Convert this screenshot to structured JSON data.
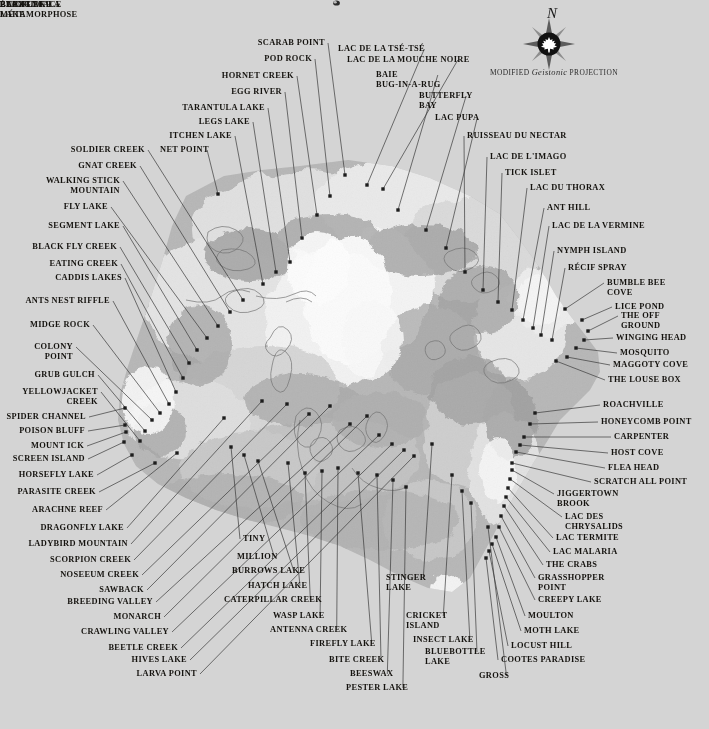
{
  "map": {
    "background_color": "#d4d4d4",
    "land_color": "#b9b9b9",
    "highland_color": "#cfcfcf",
    "ice_color": "#f2f2f2",
    "water_color": "#d8d8d8",
    "leader_color": "#3a3a3a",
    "label_color": "#15130f",
    "compass": {
      "north_letter": "N",
      "icon": "compass-rose-maple-leaf"
    },
    "projection_prefix": "MODIFIED",
    "projection_name": "Geistonic",
    "projection_suffix": "PROJECTION"
  },
  "interior_labels": [
    {
      "id": "lac-flyface",
      "text": "LAC FLYFACE",
      "x": 334,
      "y": 306,
      "align": "l"
    },
    {
      "id": "blight-lake",
      "text": "BLIGHT\nLAKE",
      "x": 331,
      "y": 318,
      "align": "l"
    },
    {
      "id": "buzz-lake",
      "text": "BUZZ LAKE",
      "x": 352,
      "y": 345,
      "align": "l"
    },
    {
      "id": "etang-metamorphose",
      "text": "ÉTANG DE LA\nMÉTAMORPHOSE",
      "x": 505,
      "y": 372,
      "align": "l"
    }
  ],
  "labels_top_left": [
    {
      "id": "scarab-point",
      "text": "SCARAB POINT",
      "tx": 325,
      "ty": 38,
      "align": "r",
      "px": 345,
      "py": 175
    },
    {
      "id": "pod-rock",
      "text": "POD ROCK",
      "tx": 312,
      "ty": 54,
      "align": "r",
      "px": 330,
      "py": 196
    },
    {
      "id": "hornet-creek",
      "text": "HORNET CREEK",
      "tx": 294,
      "ty": 71,
      "align": "r",
      "px": 317,
      "py": 215
    },
    {
      "id": "egg-river",
      "text": "EGG RIVER",
      "tx": 282,
      "ty": 87,
      "align": "r",
      "px": 302,
      "py": 238
    },
    {
      "id": "tarantula-lake",
      "text": "TARANTULA LAKE",
      "tx": 265,
      "ty": 103,
      "align": "r",
      "px": 290,
      "py": 262
    },
    {
      "id": "legs-lake",
      "text": "LEGS LAKE",
      "tx": 250,
      "ty": 117,
      "align": "r",
      "px": 276,
      "py": 272
    },
    {
      "id": "itchen-lake",
      "text": "ITCHEN LAKE",
      "tx": 232,
      "ty": 131,
      "align": "r",
      "px": 263,
      "py": 284
    },
    {
      "id": "net-point",
      "text": "NET POINT",
      "tx": 160,
      "ty": 145,
      "align": "l",
      "px": 218,
      "py": 194
    },
    {
      "id": "soldier-creek",
      "text": "SOLDIER CREEK",
      "tx": 145,
      "ty": 145,
      "align": "r",
      "px": 243,
      "py": 300
    },
    {
      "id": "gnat-creek",
      "text": "GNAT CREEK",
      "tx": 137,
      "ty": 161,
      "align": "r",
      "px": 230,
      "py": 312
    },
    {
      "id": "walking-stick",
      "text": "WALKING STICK\nMOUNTAIN",
      "tx": 120,
      "ty": 176,
      "align": "r",
      "px": 218,
      "py": 326
    },
    {
      "id": "fly-lake",
      "text": "FLY LAKE",
      "tx": 108,
      "ty": 202,
      "align": "r",
      "px": 207,
      "py": 338
    },
    {
      "id": "segment-lake",
      "text": "SEGMENT LAKE",
      "tx": 120,
      "ty": 221,
      "align": "r",
      "px": 197,
      "py": 350
    },
    {
      "id": "black-fly-creek",
      "text": "BLACK FLY CREEK",
      "tx": 117,
      "ty": 242,
      "align": "r",
      "px": 189,
      "py": 363
    },
    {
      "id": "eating-creek",
      "text": "EATING CREEK",
      "tx": 118,
      "ty": 259,
      "align": "r",
      "px": 183,
      "py": 378
    },
    {
      "id": "caddis-lakes",
      "text": "CADDIS LAKES",
      "tx": 122,
      "ty": 273,
      "align": "r",
      "px": 176,
      "py": 392
    },
    {
      "id": "ants-nest-riffle",
      "text": "ANTS NEST RIFFLE",
      "tx": 110,
      "ty": 296,
      "align": "r",
      "px": 169,
      "py": 404
    },
    {
      "id": "midge-rock",
      "text": "MIDGE ROCK",
      "tx": 90,
      "ty": 320,
      "align": "r",
      "px": 160,
      "py": 413
    },
    {
      "id": "colony-point",
      "text": "COLONY\nPOINT",
      "tx": 73,
      "ty": 342,
      "align": "r",
      "px": 152,
      "py": 420
    },
    {
      "id": "grub-gulch",
      "text": "GRUB GULCH",
      "tx": 95,
      "ty": 370,
      "align": "r",
      "px": 145,
      "py": 431
    },
    {
      "id": "yellowjacket",
      "text": "YELLOWJACKET\nCREEK",
      "tx": 98,
      "ty": 387,
      "align": "r",
      "px": 140,
      "py": 441
    },
    {
      "id": "spider-channel",
      "text": "SPIDER CHANNEL",
      "tx": 86,
      "ty": 412,
      "align": "r",
      "px": 125,
      "py": 408
    },
    {
      "id": "poison-bluff",
      "text": "POISON BLUFF",
      "tx": 85,
      "ty": 426,
      "align": "r",
      "px": 125,
      "py": 425
    },
    {
      "id": "mount-ick",
      "text": "MOUNT ICK",
      "tx": 84,
      "ty": 441,
      "align": "r",
      "px": 126,
      "py": 432
    },
    {
      "id": "screen-island",
      "text": "SCREEN ISLAND",
      "tx": 85,
      "ty": 454,
      "align": "r",
      "px": 124,
      "py": 442
    }
  ],
  "labels_left_lower": [
    {
      "id": "horsefly-lake",
      "text": "HORSEFLY LAKE",
      "tx": 94,
      "ty": 470,
      "align": "r",
      "px": 132,
      "py": 455
    },
    {
      "id": "parasite-creek",
      "text": "PARASITE CREEK",
      "tx": 96,
      "ty": 487,
      "align": "r",
      "px": 155,
      "py": 463
    },
    {
      "id": "arachne-reef",
      "text": "ARACHNE REEF",
      "tx": 103,
      "ty": 505,
      "align": "r",
      "px": 177,
      "py": 453
    },
    {
      "id": "dragonfly-lake",
      "text": "DRAGONFLY LAKE",
      "tx": 124,
      "ty": 523,
      "align": "r",
      "px": 224,
      "py": 418
    },
    {
      "id": "ladybird-mountain",
      "text": "LADYBIRD MOUNTAIN",
      "tx": 128,
      "ty": 539,
      "align": "r",
      "px": 262,
      "py": 401
    },
    {
      "id": "scorpion-creek",
      "text": "SCORPION CREEK",
      "tx": 131,
      "ty": 555,
      "align": "r",
      "px": 287,
      "py": 404
    },
    {
      "id": "noseeum-creek",
      "text": "NOSEEUM CREEK",
      "tx": 139,
      "ty": 570,
      "align": "r",
      "px": 309,
      "py": 414
    },
    {
      "id": "sawback",
      "text": "SAWBACK",
      "tx": 144,
      "ty": 585,
      "align": "r",
      "px": 330,
      "py": 406
    },
    {
      "id": "breeding-valley",
      "text": "BREEDING VALLEY",
      "tx": 153,
      "ty": 597,
      "align": "r",
      "px": 350,
      "py": 424
    },
    {
      "id": "monarch",
      "text": "MONARCH",
      "tx": 161,
      "ty": 612,
      "align": "r",
      "px": 367,
      "py": 416
    },
    {
      "id": "crawling-valley",
      "text": "CRAWLING VALLEY",
      "tx": 169,
      "ty": 627,
      "align": "r",
      "px": 379,
      "py": 435
    },
    {
      "id": "beetle-creek",
      "text": "BEETLE CREEK",
      "tx": 178,
      "ty": 643,
      "align": "r",
      "px": 392,
      "py": 444
    },
    {
      "id": "hives-lake",
      "text": "HIVES LAKE",
      "tx": 187,
      "ty": 655,
      "align": "r",
      "px": 404,
      "py": 450
    },
    {
      "id": "larva-point",
      "text": "LARVA POINT",
      "tx": 197,
      "ty": 669,
      "align": "r",
      "px": 414,
      "py": 456
    }
  ],
  "labels_bottom_centre": [
    {
      "id": "tiny",
      "text": "TINY",
      "tx": 243,
      "ty": 534,
      "align": "l",
      "px": 231,
      "py": 447
    },
    {
      "id": "million",
      "text": "MILLION",
      "tx": 237,
      "ty": 552,
      "align": "l",
      "px": 244,
      "py": 455
    },
    {
      "id": "burrows-lake",
      "text": "BURROWS LAKE",
      "tx": 232,
      "ty": 566,
      "align": "l",
      "px": 258,
      "py": 461
    },
    {
      "id": "hatch-lake",
      "text": "HATCH LAKE",
      "tx": 248,
      "ty": 581,
      "align": "l",
      "px": 288,
      "py": 463
    },
    {
      "id": "caterpillar-creek",
      "text": "CATERPILLAR CREEK",
      "tx": 224,
      "ty": 595,
      "align": "l",
      "px": 305,
      "py": 473
    },
    {
      "id": "wasp-lake",
      "text": "WASP LAKE",
      "tx": 273,
      "ty": 611,
      "align": "l",
      "px": 322,
      "py": 471
    },
    {
      "id": "antenna-creek",
      "text": "ANTENNA CREEK",
      "tx": 270,
      "ty": 625,
      "align": "l",
      "px": 338,
      "py": 468
    },
    {
      "id": "firefly-lake",
      "text": "FIREFLY LAKE",
      "tx": 310,
      "ty": 639,
      "align": "l",
      "px": 358,
      "py": 473
    },
    {
      "id": "bite-creek",
      "text": "BITE CREEK",
      "tx": 329,
      "ty": 655,
      "align": "l",
      "px": 377,
      "py": 475
    },
    {
      "id": "beeswax",
      "text": "BEESWAX",
      "tx": 350,
      "ty": 669,
      "align": "l",
      "px": 393,
      "py": 480
    },
    {
      "id": "pester-lake",
      "text": "PESTER LAKE",
      "tx": 346,
      "ty": 683,
      "align": "l",
      "px": 406,
      "py": 487
    },
    {
      "id": "stinger-lake",
      "text": "STINGER\nLAKE",
      "tx": 386,
      "ty": 573,
      "align": "l",
      "px": 432,
      "py": 444
    },
    {
      "id": "cricket-island",
      "text": "CRICKET\nISLAND",
      "tx": 406,
      "ty": 611,
      "align": "l",
      "px": 452,
      "py": 475
    },
    {
      "id": "insect-lake",
      "text": "INSECT LAKE",
      "tx": 413,
      "ty": 635,
      "align": "l",
      "px": 462,
      "py": 491
    },
    {
      "id": "bluebottle-lake",
      "text": "BLUEBOTTLE\nLAKE",
      "tx": 425,
      "ty": 647,
      "align": "l",
      "px": 471,
      "py": 503
    },
    {
      "id": "gross",
      "text": "GROSS",
      "tx": 479,
      "ty": 671,
      "align": "l",
      "px": 488,
      "py": 527
    }
  ],
  "labels_right_upper": [
    {
      "id": "lac-tsetse",
      "text": "LAC DE LA TSÉ-TSÉ",
      "tx": 338,
      "ty": 44,
      "align": "l",
      "px": 367,
      "py": 185
    },
    {
      "id": "lac-mouche-noire",
      "text": "LAC DE LA MOUCHE NOIRE",
      "tx": 347,
      "ty": 55,
      "align": "l",
      "px": 383,
      "py": 189
    },
    {
      "id": "baie-bug-in-a-rug",
      "text": "BAIE\nBUG-IN-A-RUG",
      "tx": 376,
      "ty": 70,
      "align": "l",
      "px": 398,
      "py": 210
    },
    {
      "id": "butterfly-bay",
      "text": "BUTTERFLY\nBAY",
      "tx": 419,
      "ty": 91,
      "align": "l",
      "px": 426,
      "py": 230
    },
    {
      "id": "lac-pupa",
      "text": "LAC PUPA",
      "tx": 435,
      "ty": 113,
      "align": "l",
      "px": 446,
      "py": 248
    },
    {
      "id": "ruisseau-nectar",
      "text": "RUISSEAU DU NECTAR",
      "tx": 467,
      "ty": 131,
      "align": "l",
      "px": 465,
      "py": 272
    },
    {
      "id": "lac-imago",
      "text": "LAC DE L'IMAGO",
      "tx": 490,
      "ty": 152,
      "align": "l",
      "px": 483,
      "py": 290
    },
    {
      "id": "tick-islet",
      "text": "TICK ISLET",
      "tx": 505,
      "ty": 168,
      "align": "l",
      "px": 498,
      "py": 302
    },
    {
      "id": "lac-du-thorax",
      "text": "LAC DU THORAX",
      "tx": 530,
      "ty": 183,
      "align": "l",
      "px": 512,
      "py": 310
    },
    {
      "id": "ant-hill",
      "text": "ANT HILL",
      "tx": 547,
      "ty": 203,
      "align": "l",
      "px": 523,
      "py": 320
    },
    {
      "id": "lac-de-la-vermine",
      "text": "LAC DE LA VERMINE",
      "tx": 552,
      "ty": 221,
      "align": "l",
      "px": 533,
      "py": 328
    },
    {
      "id": "nymph-island",
      "text": "NYMPH ISLAND",
      "tx": 557,
      "ty": 246,
      "align": "l",
      "px": 541,
      "py": 335
    },
    {
      "id": "recif-spray",
      "text": "RÉCIF SPRAY",
      "tx": 568,
      "ty": 263,
      "align": "l",
      "px": 552,
      "py": 340
    },
    {
      "id": "bumble-bee-cove",
      "text": "BUMBLE BEE\nCOVE",
      "tx": 607,
      "ty": 278,
      "align": "l",
      "px": 565,
      "py": 309
    },
    {
      "id": "lice-pond",
      "text": "LICE POND",
      "tx": 615,
      "ty": 302,
      "align": "l",
      "px": 582,
      "py": 320
    },
    {
      "id": "the-off-ground",
      "text": "THE OFF\nGROUND",
      "tx": 621,
      "ty": 311,
      "align": "l",
      "px": 588,
      "py": 331
    },
    {
      "id": "winging-head",
      "text": "WINGING HEAD",
      "tx": 616,
      "ty": 333,
      "align": "l",
      "px": 584,
      "py": 340
    },
    {
      "id": "mosquito",
      "text": "MOSQUITO",
      "tx": 620,
      "ty": 348,
      "align": "l",
      "px": 576,
      "py": 348
    },
    {
      "id": "maggoty-cove",
      "text": "MAGGOTY COVE",
      "tx": 613,
      "ty": 360,
      "align": "l",
      "px": 567,
      "py": 357
    },
    {
      "id": "the-louse-box",
      "text": "THE LOUSE BOX",
      "tx": 608,
      "ty": 375,
      "align": "l",
      "px": 556,
      "py": 361
    }
  ],
  "labels_right_lower": [
    {
      "id": "roachville",
      "text": "ROACHVILLE",
      "tx": 603,
      "ty": 400,
      "align": "l",
      "px": 535,
      "py": 413
    },
    {
      "id": "honeycomb-point",
      "text": "HONEYCOMB POINT",
      "tx": 601,
      "ty": 417,
      "align": "l",
      "px": 530,
      "py": 424
    },
    {
      "id": "carpenter",
      "text": "CARPENTER",
      "tx": 614,
      "ty": 432,
      "align": "l",
      "px": 524,
      "py": 437
    },
    {
      "id": "host-cove",
      "text": "HOST COVE",
      "tx": 611,
      "ty": 448,
      "align": "l",
      "px": 520,
      "py": 445
    },
    {
      "id": "flea-head",
      "text": "FLEA HEAD",
      "tx": 608,
      "ty": 463,
      "align": "l",
      "px": 516,
      "py": 452
    },
    {
      "id": "scratch-all-point",
      "text": "SCRATCH ALL POINT",
      "tx": 594,
      "ty": 477,
      "align": "l",
      "px": 512,
      "py": 463
    },
    {
      "id": "jiggertown-brook",
      "text": "JIGGERTOWN\nBROOK",
      "tx": 557,
      "ty": 489,
      "align": "l",
      "px": 512,
      "py": 470
    },
    {
      "id": "lac-des-chrysalids",
      "text": "LAC DES\nCHRYSALIDS",
      "tx": 565,
      "ty": 512,
      "align": "l",
      "px": 510,
      "py": 479
    },
    {
      "id": "lac-termite",
      "text": "LAC TERMITE",
      "tx": 556,
      "ty": 533,
      "align": "l",
      "px": 508,
      "py": 488
    },
    {
      "id": "lac-malaria",
      "text": "LAC MALARIA",
      "tx": 553,
      "ty": 547,
      "align": "l",
      "px": 506,
      "py": 497
    },
    {
      "id": "the-crabs",
      "text": "THE CRABS",
      "tx": 546,
      "ty": 560,
      "align": "l",
      "px": 504,
      "py": 506
    },
    {
      "id": "grasshopper-point",
      "text": "GRASSHOPPER\nPOINT",
      "tx": 538,
      "ty": 573,
      "align": "l",
      "px": 501,
      "py": 516
    },
    {
      "id": "creepy-lake",
      "text": "CREEPY LAKE",
      "tx": 538,
      "ty": 595,
      "align": "l",
      "px": 499,
      "py": 527
    },
    {
      "id": "moulton",
      "text": "MOULTON",
      "tx": 528,
      "ty": 611,
      "align": "l",
      "px": 496,
      "py": 537
    },
    {
      "id": "moth-lake",
      "text": "MOTH LAKE",
      "tx": 524,
      "ty": 626,
      "align": "l",
      "px": 492,
      "py": 544
    },
    {
      "id": "locust-hill",
      "text": "LOCUST HILL",
      "tx": 511,
      "ty": 641,
      "align": "l",
      "px": 489,
      "py": 551
    },
    {
      "id": "cootes-paradise",
      "text": "COOTES PARADISE",
      "tx": 501,
      "ty": 655,
      "align": "l",
      "px": 486,
      "py": 558
    }
  ]
}
